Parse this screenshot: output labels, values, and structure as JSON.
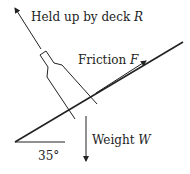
{
  "diagram": {
    "labels": {
      "normal": {
        "text": "Held up by deck",
        "symbol": "R"
      },
      "friction": {
        "text": "Friction",
        "symbol": "F"
      },
      "weight": {
        "text": "Weight",
        "symbol": "W"
      },
      "angle": "35°"
    },
    "colors": {
      "line": "#222222",
      "background": "#ffffff"
    }
  }
}
